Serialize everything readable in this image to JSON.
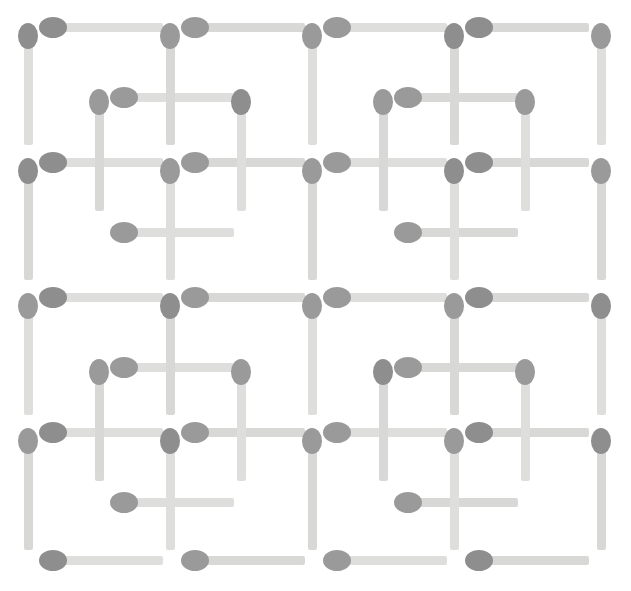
{
  "figure": {
    "kind": "matchstick-puzzle",
    "width": 631,
    "height": 591,
    "background_color": "#ffffff"
  },
  "style": {
    "stick_color": "#dededc",
    "stick_color_alt": "#d8d8d6",
    "head_color": "#8e8e8e",
    "head_color_alt": "#9a9a9a",
    "stick_thickness": 9,
    "head_width": 20,
    "head_height": 26,
    "match_length": 118
  },
  "geometry": {
    "outer_columns_x": [
      28,
      170,
      312,
      454,
      601
    ],
    "outer_rows_y": [
      27,
      162,
      297,
      432,
      560
    ],
    "inner_columns_x": [
      99,
      241,
      383,
      525
    ],
    "inner_rows_y": [
      97,
      232,
      367,
      502
    ],
    "note": "4x4 outer square lattice with an offset inner cross lattice"
  },
  "matches": {
    "count_total": 72,
    "horizontal_count": 36,
    "vertical_count": 36,
    "groups": [
      {
        "name": "outer-horizontal",
        "orientation": "horizontal",
        "rows_y": [
          27,
          162,
          297,
          432,
          560
        ],
        "starts_x": [
          45,
          187,
          329,
          471
        ]
      },
      {
        "name": "outer-vertical",
        "orientation": "vertical",
        "cols_x": [
          28,
          170,
          312,
          454,
          601
        ],
        "starts_y": [
          27,
          162,
          297,
          432
        ]
      },
      {
        "name": "inner-horizontal",
        "orientation": "horizontal",
        "rows_y": [
          97,
          232,
          367,
          502
        ],
        "starts_x": [
          116,
          400
        ]
      },
      {
        "name": "inner-vertical",
        "orientation": "vertical",
        "cols_x": [
          99,
          241,
          383,
          525
        ],
        "starts_y": [
          93,
          363
        ]
      }
    ]
  },
  "chart_data": {
    "type": "scatter",
    "xlabel": "",
    "ylabel": "",
    "xlim": [
      0,
      631
    ],
    "ylim": [
      0,
      591
    ],
    "grid": false,
    "legend": "none",
    "series": [
      {
        "name": "horizontal-matches",
        "values": [
          [
            45,
            27
          ],
          [
            187,
            27
          ],
          [
            329,
            27
          ],
          [
            471,
            27
          ],
          [
            116,
            97
          ],
          [
            400,
            97
          ],
          [
            45,
            162
          ],
          [
            187,
            162
          ],
          [
            329,
            162
          ],
          [
            471,
            162
          ],
          [
            116,
            232
          ],
          [
            400,
            232
          ],
          [
            45,
            297
          ],
          [
            187,
            297
          ],
          [
            329,
            297
          ],
          [
            471,
            297
          ],
          [
            116,
            367
          ],
          [
            400,
            367
          ],
          [
            45,
            432
          ],
          [
            187,
            432
          ],
          [
            329,
            432
          ],
          [
            471,
            432
          ],
          [
            116,
            502
          ],
          [
            400,
            502
          ],
          [
            45,
            560
          ],
          [
            187,
            560
          ],
          [
            329,
            560
          ],
          [
            471,
            560
          ]
        ]
      },
      {
        "name": "vertical-matches",
        "values": [
          [
            28,
            27
          ],
          [
            170,
            27
          ],
          [
            312,
            27
          ],
          [
            454,
            27
          ],
          [
            601,
            27
          ],
          [
            99,
            93
          ],
          [
            241,
            93
          ],
          [
            383,
            93
          ],
          [
            525,
            93
          ],
          [
            28,
            162
          ],
          [
            170,
            162
          ],
          [
            312,
            162
          ],
          [
            454,
            162
          ],
          [
            601,
            162
          ],
          [
            28,
            297
          ],
          [
            170,
            297
          ],
          [
            312,
            297
          ],
          [
            454,
            297
          ],
          [
            601,
            297
          ],
          [
            99,
            363
          ],
          [
            241,
            363
          ],
          [
            383,
            363
          ],
          [
            525,
            363
          ],
          [
            28,
            432
          ],
          [
            170,
            432
          ],
          [
            312,
            432
          ],
          [
            454,
            432
          ],
          [
            601,
            432
          ]
        ]
      }
    ]
  }
}
